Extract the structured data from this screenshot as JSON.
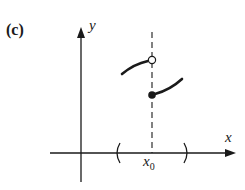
{
  "figure": {
    "panel_label": "(c)",
    "y_axis_label": "y",
    "x_axis_label": "x",
    "point_label": "x",
    "point_label_sub": "0",
    "colors": {
      "ink": "#1a1a1a",
      "background": "#ffffff"
    }
  }
}
